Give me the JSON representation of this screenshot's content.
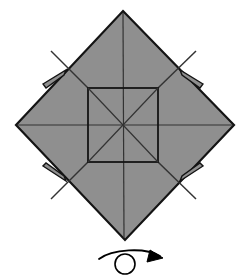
{
  "diagram": {
    "type": "origami-fold-step",
    "canvas": {
      "width": 245,
      "height": 278
    },
    "colors": {
      "paper_fill": "#8f8f8f",
      "paper_outline": "#141414",
      "crease_line": "#333333",
      "background": "#ffffff",
      "arrow": "#000000"
    },
    "shapes": {
      "outer_diamond": {
        "name": "folded-paper-diamond",
        "points": "123,11 234,125 125,240 16,125",
        "description": "Large square rotated 45 degrees (diamond) filled medium gray"
      },
      "inner_square": {
        "name": "center-square",
        "x": 88,
        "y": 88,
        "width": 70,
        "height": 74,
        "description": "Central square formed by the four blintz-folded corners"
      }
    },
    "creases": {
      "vertical_axis": {
        "x1": 123,
        "y1": 13,
        "x2": 124,
        "y2": 238
      },
      "horizontal_axis": {
        "x1": 18,
        "y1": 125,
        "x2": 232,
        "y2": 125
      },
      "square_diagonal_1": {
        "x1": 88,
        "y1": 88,
        "x2": 158,
        "y2": 162
      },
      "square_diagonal_2": {
        "x1": 158,
        "y1": 88,
        "x2": 88,
        "y2": 162
      },
      "corner_fold_top_left": {
        "x1": 88,
        "y1": 88,
        "x2": 51,
        "y2": 51
      },
      "corner_fold_top_right": {
        "x1": 158,
        "y1": 88,
        "x2": 196,
        "y2": 51
      },
      "corner_fold_bottom_left": {
        "x1": 88,
        "y1": 162,
        "x2": 51,
        "y2": 199
      },
      "corner_fold_bottom_right": {
        "x1": 158,
        "y1": 162,
        "x2": 196,
        "y2": 199
      }
    },
    "flaps": [
      {
        "name": "edge-flap-top-left",
        "position": "upper-left-edge",
        "points": "43,84 66,70 64,75 46,88"
      },
      {
        "name": "edge-flap-top-right",
        "points": "203,84 180,70 182,75 200,88"
      },
      {
        "name": "edge-flap-bottom-left",
        "points": "43,166 66,181 64,176 46,163"
      },
      {
        "name": "edge-flap-bottom-right",
        "points": "203,166 180,181 182,176 200,163"
      }
    ],
    "symbol": {
      "name": "turn-over-symbol",
      "label": "Turn the model over",
      "curve": "M 99,259 C 112,249 145,247 160,256",
      "loop": {
        "cx": 125,
        "cy": 264,
        "r": 10
      },
      "arrowhead": "150,250 163,258 147,262"
    }
  }
}
